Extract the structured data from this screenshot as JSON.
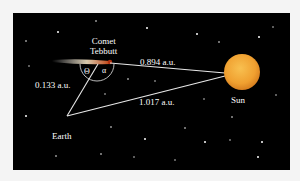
{
  "diagram": {
    "labels": {
      "comet_line1": "Comet",
      "comet_line2": "Tebbutt",
      "earth": "Earth",
      "sun": "Sun",
      "dist_earth_comet": "0.133 a.u.",
      "dist_comet_sun": "0.894 a.u.",
      "dist_earth_sun": "1.017 a.u.",
      "angle_theta": "Θ",
      "angle_alpha": "α"
    },
    "colors": {
      "background": "#000000",
      "frame": "#f4f4f4",
      "lines": "#e8e8e8",
      "sun": "#f0a030",
      "comet_tail": "#e8d8b0"
    }
  }
}
